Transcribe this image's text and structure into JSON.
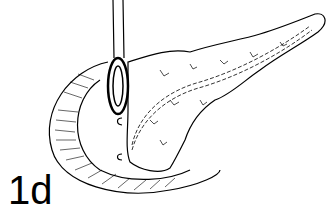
{
  "figure": {
    "label": "1d"
  }
}
